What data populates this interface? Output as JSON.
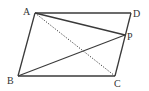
{
  "diagram": {
    "type": "geometry-figure",
    "points": {
      "A": {
        "label": "A",
        "x": 35,
        "y": 13
      },
      "B": {
        "label": "B",
        "x": 18,
        "y": 76
      },
      "C": {
        "label": "C",
        "x": 115,
        "y": 76
      },
      "D": {
        "label": "D",
        "x": 131,
        "y": 13
      },
      "P": {
        "label": "P",
        "x": 125,
        "y": 35
      }
    },
    "segments": [
      {
        "from": "A",
        "to": "D",
        "style": "solid"
      },
      {
        "from": "A",
        "to": "B",
        "style": "solid"
      },
      {
        "from": "B",
        "to": "C",
        "style": "solid"
      },
      {
        "from": "C",
        "to": "D",
        "style": "solid"
      },
      {
        "from": "A",
        "to": "P",
        "style": "solid"
      },
      {
        "from": "B",
        "to": "P",
        "style": "solid"
      },
      {
        "from": "A",
        "to": "C",
        "style": "dotted"
      }
    ],
    "colors": {
      "line": "#3a3a3a",
      "label": "#333333",
      "background": "#ffffff"
    }
  }
}
